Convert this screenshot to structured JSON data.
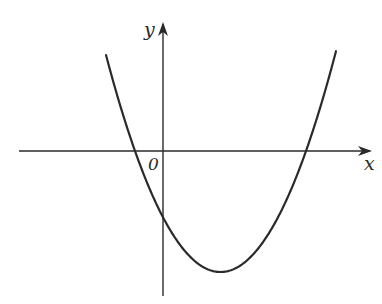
{
  "figure": {
    "axes": {
      "x_label": "x",
      "y_label": "y",
      "origin_label": "0"
    },
    "colors": {
      "stroke": "#2a2a2a",
      "background": "#ffffff"
    },
    "curve": {
      "type": "parabola",
      "opens": "upward",
      "x_intercepts": "one negative, one positive",
      "y_intercept": "negative",
      "vertex": "fourth quadrant (x>0, y<0)"
    }
  }
}
